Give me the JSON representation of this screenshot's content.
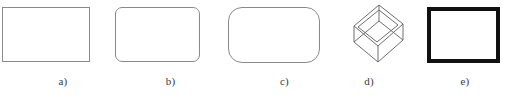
{
  "figure": {
    "background_color": "#ffffff",
    "width": 505,
    "height": 98,
    "items": [
      {
        "id": "a",
        "caption": "a)",
        "shape": "rectangle-sharp-corners",
        "stroke_color": "#8a8a8a",
        "stroke_width": 1,
        "corner_radius": 0,
        "fill": "#ffffff"
      },
      {
        "id": "b",
        "caption": "b)",
        "shape": "rectangle-small-rounded-corners",
        "stroke_color": "#8a8a8a",
        "stroke_width": 1,
        "corner_radius": 7,
        "fill": "#ffffff"
      },
      {
        "id": "c",
        "caption": "c)",
        "shape": "rectangle-large-rounded-corners",
        "stroke_color": "#8a8a8a",
        "stroke_width": 1,
        "corner_radius": 14,
        "fill": "#ffffff"
      },
      {
        "id": "d",
        "caption": "d)",
        "shape": "isometric-wireframe-box",
        "stroke_color": "#6e6e6e",
        "stroke_width": 1,
        "corner_radius": 0,
        "fill": "none"
      },
      {
        "id": "e",
        "caption": "e)",
        "shape": "rectangle-thick-black-border",
        "stroke_color": "#111111",
        "stroke_width": 4,
        "corner_radius": 0,
        "fill": "#ffffff"
      }
    ]
  }
}
